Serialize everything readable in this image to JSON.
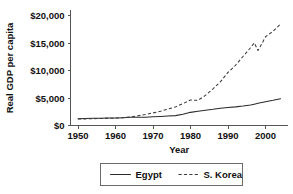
{
  "chart_data": {
    "type": "line",
    "title": "",
    "xlabel": "Year",
    "ylabel": "Real GDP per capita",
    "xlim": [
      1948,
      2006
    ],
    "ylim": [
      0,
      21000
    ],
    "grid": false,
    "legend_position": "bottom-center",
    "x_ticks": [
      1950,
      1960,
      1970,
      1980,
      1990,
      2000
    ],
    "x_tick_labels": [
      "1950",
      "1960",
      "1970",
      "1980",
      "1990",
      "2000"
    ],
    "y_ticks": [
      0,
      5000,
      10000,
      15000,
      20000
    ],
    "y_tick_labels": [
      "$0",
      "$5,000",
      "$10,000",
      "$15,000",
      "$20,000"
    ],
    "x": [
      1950,
      1952,
      1954,
      1956,
      1958,
      1960,
      1962,
      1964,
      1966,
      1968,
      1970,
      1972,
      1974,
      1976,
      1978,
      1980,
      1982,
      1984,
      1986,
      1988,
      1990,
      1992,
      1994,
      1996,
      1997,
      1998,
      1999,
      2000,
      2002,
      2004
    ],
    "series": [
      {
        "name": "Egypt",
        "style": "solid",
        "color": "#2b2b2b",
        "values": [
          1250,
          1290,
          1330,
          1340,
          1360,
          1360,
          1420,
          1500,
          1500,
          1500,
          1600,
          1660,
          1720,
          1800,
          2050,
          2400,
          2600,
          2800,
          2950,
          3150,
          3300,
          3400,
          3550,
          3750,
          3900,
          4050,
          4200,
          4350,
          4600,
          4900
        ]
      },
      {
        "name": "S. Korea",
        "style": "dashed",
        "color": "#3a3a3a",
        "values": [
          1180,
          1210,
          1250,
          1280,
          1320,
          1350,
          1420,
          1560,
          1780,
          2000,
          2300,
          2600,
          3000,
          3400,
          4000,
          4650,
          4600,
          5500,
          6700,
          8000,
          9700,
          11000,
          12600,
          14200,
          15100,
          13700,
          14900,
          16200,
          17200,
          18500
        ]
      }
    ]
  },
  "legend": {
    "entries": [
      {
        "label": "Egypt",
        "style": "solid"
      },
      {
        "label": "S. Korea",
        "style": "dashed"
      }
    ]
  }
}
